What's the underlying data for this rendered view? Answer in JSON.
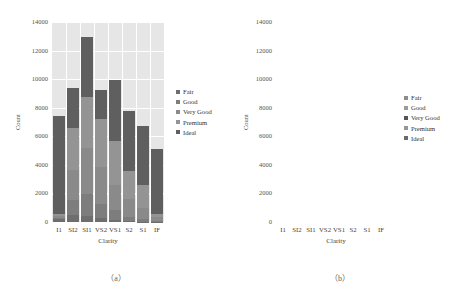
{
  "figure": {
    "captions": {
      "a": "（a）",
      "b": "（b）"
    }
  },
  "chart_data": [
    {
      "id": "a",
      "type": "bar",
      "stacked": true,
      "style": "gray-panel-white-grid",
      "title": "",
      "xlabel": "Clarity",
      "ylabel": "Count",
      "ylim": [
        0,
        14000
      ],
      "yticks": [
        0,
        2000,
        4000,
        6000,
        8000,
        10000,
        12000,
        14000
      ],
      "grid": true,
      "legend_position": "right",
      "categories": [
        "I1",
        "SI2",
        "SI1",
        "VS2",
        "VS1",
        "S2",
        "S1",
        "IF"
      ],
      "series": [
        {
          "name": "Fair",
          "color": "#6e6e6e",
          "values": [
            210,
            466,
            408,
            261,
            170,
            69,
            17,
            9
          ]
        },
        {
          "name": "Good",
          "color": "#7d7d7d",
          "values": [
            96,
            1081,
            1560,
            978,
            648,
            286,
            186,
            71
          ]
        },
        {
          "name": "Very Good",
          "color": "#8a8a8a",
          "values": [
            84,
            2100,
            3240,
            2591,
            1775,
            1235,
            789,
            268
          ]
        },
        {
          "name": "Premium",
          "color": "#949494",
          "values": [
            205,
            2949,
            3575,
            3357,
            3095,
            1989,
            1603,
            230
          ]
        },
        {
          "name": "Ideal",
          "color": "#5f5f5f",
          "values": [
            6850,
            2800,
            4200,
            2050,
            4250,
            4200,
            4100,
            4520
          ]
        }
      ],
      "totals": [
        7445,
        9396,
        12983,
        9237,
        9938,
        7779,
        6695,
        5098
      ]
    },
    {
      "id": "b",
      "type": "bar",
      "stacked": true,
      "style": "white-panel-border",
      "title": "",
      "xlabel": "Clarity",
      "ylabel": "Count",
      "ylim": [
        0,
        14000
      ],
      "yticks": [
        0,
        2000,
        4000,
        6000,
        8000,
        10000,
        12000,
        14000
      ],
      "grid": false,
      "legend_position": "right",
      "categories": [
        "I1",
        "SI2",
        "SI1",
        "VS2",
        "VS1",
        "S2",
        "S1",
        "IF"
      ],
      "series": [
        {
          "name": "Fair",
          "color": "#8c8c8c",
          "values": [
            210,
            466,
            408,
            261,
            170,
            69,
            17,
            9
          ]
        },
        {
          "name": "Good",
          "color": "#9b9b9b",
          "values": [
            1100,
            1000,
            1700,
            900,
            800,
            1300,
            1250,
            1300
          ]
        },
        {
          "name": "Very Good",
          "color": "#555555",
          "values": [
            1350,
            2400,
            3300,
            1900,
            2250,
            2000,
            1800,
            1200
          ]
        },
        {
          "name": "Premium",
          "color": "#969696",
          "values": [
            1100,
            2000,
            2100,
            2150,
            2650,
            1900,
            1550,
            1200
          ]
        },
        {
          "name": "Ideal",
          "color": "#6a6a6a",
          "values": [
            3700,
            3530,
            5475,
            4027,
            4068,
            2510,
            2078,
            1389
          ]
        }
      ],
      "totals": [
        7445,
        9396,
        12983,
        9237,
        9938,
        7779,
        6695,
        5098
      ]
    }
  ]
}
